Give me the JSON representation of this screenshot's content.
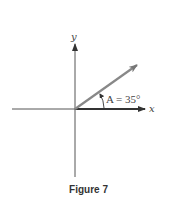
{
  "figure": {
    "caption": "Figure 7",
    "x_axis_label": "x",
    "y_axis_label": "y",
    "angle_label": "A = 35°",
    "angle_name": "A",
    "angle_degrees": 35,
    "colors": {
      "axis": "#555555",
      "vector": "#777777",
      "text": "#444444"
    }
  }
}
